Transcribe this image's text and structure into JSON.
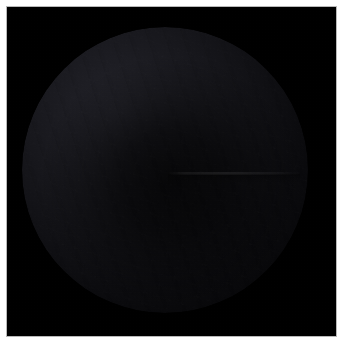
{
  "figure": {
    "name": "dark-disc-plate",
    "kind": "astronomical-disc-image",
    "width": 344,
    "height": 346,
    "caption": "",
    "background_color": "#ffffff"
  },
  "plate": {
    "name": "black-imaging-plate",
    "background_color": "#000000",
    "border_color": "#b9b9b9",
    "left": 7,
    "top": 7,
    "width": 329,
    "height": 329
  },
  "disc": {
    "name": "dark-sphere",
    "center_x": 165,
    "center_y": 170,
    "radius": 143,
    "core_color": "#050507",
    "limb_color": "#2b2b33",
    "illumination": "upper-left",
    "limb_brightened": true,
    "label": ""
  },
  "features": [
    {
      "name": "horizontal-seam",
      "description": "faint horizontal discontinuity right of centre",
      "y": 172,
      "x_start": 168,
      "x_end": 300
    }
  ],
  "annotations": {
    "title": "",
    "subtitle": "",
    "scale_bar": "",
    "north_arrow": ""
  }
}
